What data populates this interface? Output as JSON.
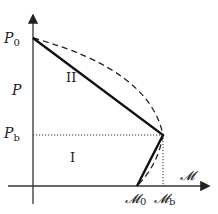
{
  "diagram": {
    "axes": {
      "y_label": "P",
      "x_label": "𝓜"
    },
    "ticks": {
      "p0": {
        "base": "P",
        "sub": "0"
      },
      "pb": {
        "base": "P",
        "sub": "b"
      },
      "m0": {
        "base": "𝓜",
        "sub": "0"
      },
      "mb": {
        "base": "𝓜",
        "sub": "b"
      }
    },
    "regions": {
      "upper": "II",
      "lower": "I"
    },
    "lines": {
      "solid": "piecewise linear P0 → (𝓜b, Pb) → 𝓜0",
      "dashed": "curved envelope P0 → (𝓜b, Pb) → 𝓜0",
      "dotted": "guides at Pb and 𝓜b"
    },
    "colors": {
      "line": "#1a1a1a",
      "axis": "#333333",
      "background": "#ffffff"
    }
  }
}
